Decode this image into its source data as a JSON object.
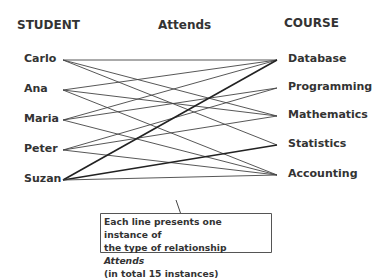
{
  "headers": {
    "left": "STUDENT",
    "middle": "Attends",
    "right": "COURSE"
  },
  "students": [
    {
      "name": "Carlo",
      "y": 60
    },
    {
      "name": "Ana",
      "y": 90
    },
    {
      "name": "Maria",
      "y": 120
    },
    {
      "name": "Peter",
      "y": 150
    },
    {
      "name": "Suzan",
      "y": 180
    }
  ],
  "courses": [
    {
      "name": "Database",
      "y": 60
    },
    {
      "name": "Programming",
      "y": 88
    },
    {
      "name": "Mathematics",
      "y": 116
    },
    {
      "name": "Statistics",
      "y": 145
    },
    {
      "name": "Accounting",
      "y": 175
    }
  ],
  "edges": [
    [
      0,
      0
    ],
    [
      0,
      2
    ],
    [
      0,
      3
    ],
    [
      1,
      0
    ],
    [
      1,
      2
    ],
    [
      1,
      4
    ],
    [
      2,
      0
    ],
    [
      2,
      1
    ],
    [
      2,
      4
    ],
    [
      3,
      1
    ],
    [
      3,
      2
    ],
    [
      3,
      4
    ],
    [
      4,
      0
    ],
    [
      4,
      3
    ],
    [
      4,
      4
    ]
  ],
  "callout": {
    "line1": "Each line presents one instance of",
    "line2_prefix": "the type of relationship ",
    "line2_italic": "Attends",
    "line3": "(in total 15 instances)"
  }
}
